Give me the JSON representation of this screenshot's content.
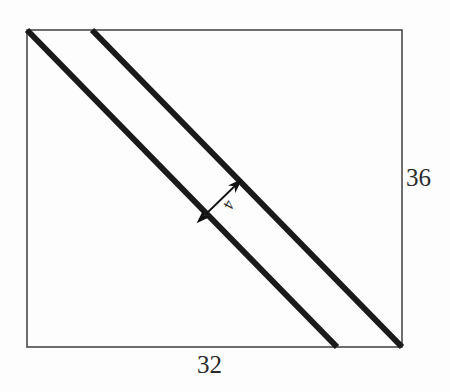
{
  "figure": {
    "kind": "hand-drawn-geometry-diagram",
    "background_color": "#fdfdfd",
    "ink_color": "#1a1a1a",
    "border_color": "#4a4a4a"
  },
  "rectangle": {
    "name": "outer-rectangle",
    "left": 27,
    "top": 30,
    "right": 402,
    "bottom": 347,
    "stroke_width": 1.6
  },
  "diagonals": [
    {
      "name": "diagonal-upper-left",
      "x1": 27,
      "y1": 30,
      "x2": 337,
      "y2": 347,
      "stroke_width": 6
    },
    {
      "name": "diagonal-lower-right",
      "x1": 92,
      "y1": 30,
      "x2": 402,
      "y2": 347,
      "stroke_width": 6
    }
  ],
  "dimension_arrow": {
    "name": "band-width-arrow",
    "x1": 206,
    "y1": 214,
    "x2": 241,
    "y2": 180,
    "stroke_width": 1.8,
    "double_headed": true
  },
  "labels": {
    "height": "36",
    "width": "32",
    "band_width": "4"
  },
  "chart_data": {
    "type": "diagram",
    "title": "",
    "shapes": [
      {
        "type": "rectangle",
        "label_width": "32",
        "label_height": "36",
        "width_value": 32,
        "height_value": 36
      },
      {
        "type": "band",
        "label": "4",
        "value": 4,
        "orientation": "diagonal",
        "count": 1
      }
    ],
    "annotations": [
      "36",
      "32",
      "4"
    ]
  }
}
